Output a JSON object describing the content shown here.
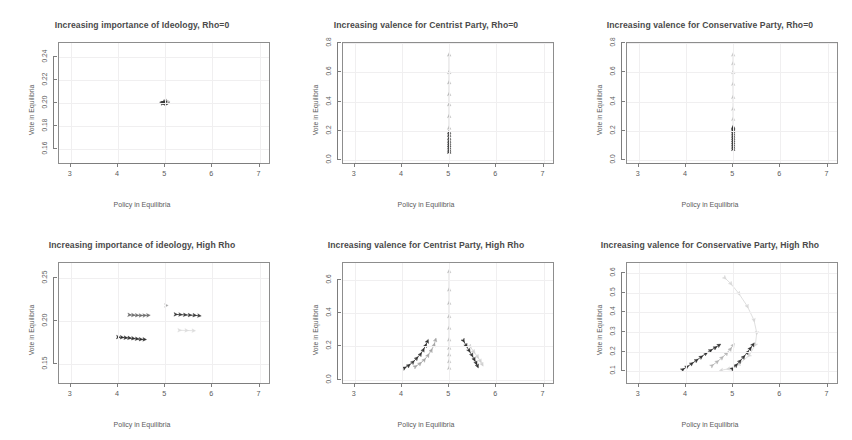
{
  "figure": {
    "layout": "2 rows x 3 columns of scatter/trajectory panels",
    "background": "#ffffff",
    "shared_xlabel": "Policy in Equilibria",
    "shared_ylabel": "Vote in Equilibria"
  },
  "chart_data": [
    {
      "id": "panel-1",
      "type": "scatter",
      "title": "Increasing importance of Ideology, Rho=0",
      "xlabel": "Policy in Equilibria",
      "ylabel": "Vote in Equilibria",
      "xlim": [
        2.75,
        7.2
      ],
      "ylim": [
        0.148,
        0.252
      ],
      "xticks": [
        3,
        4,
        5,
        6,
        7
      ],
      "xticklabels": [
        "3",
        "4",
        "5",
        "6",
        "7"
      ],
      "yticks": [
        0.16,
        0.18,
        0.2,
        0.22,
        0.24
      ],
      "yticklabels": [
        "0.16",
        "0.18",
        "0.20",
        "0.22",
        "0.24"
      ],
      "grid": true,
      "legend": "none",
      "series": [
        {
          "name": "cluster-at-center",
          "color": "#3a3a3a",
          "x": [
            4.93,
            4.95,
            4.97,
            4.99,
            5.01,
            5.03,
            5.05,
            5.02,
            4.98,
            4.96
          ],
          "y": [
            0.2,
            0.2005,
            0.201,
            0.2,
            0.1995,
            0.2,
            0.2005,
            0.2015,
            0.1998,
            0.2002
          ]
        },
        {
          "name": "faint-marker",
          "color": "#c9c9c9",
          "x": [
            5.06
          ],
          "y": [
            0.2012
          ]
        }
      ]
    },
    {
      "id": "panel-2",
      "type": "scatter",
      "title": "Increasing valence for Centrist Party, Rho=0",
      "xlabel": "Policy in Equilibria",
      "ylabel": "Vote in Equilibria",
      "xlim": [
        2.75,
        7.2
      ],
      "ylim": [
        -0.02,
        0.8
      ],
      "xticks": [
        3,
        4,
        5,
        6,
        7
      ],
      "xticklabels": [
        "3",
        "4",
        "5",
        "6",
        "7"
      ],
      "yticks": [
        0.0,
        0.2,
        0.4,
        0.6,
        0.8
      ],
      "yticklabels": [
        "0.0",
        "0.2",
        "0.4",
        "0.6",
        "0.8"
      ],
      "grid": true,
      "legend": "none",
      "series": [
        {
          "name": "centrist-rising-valence",
          "color": "#b8b8b8",
          "x": [
            5.0,
            5.0,
            5.0,
            5.0,
            5.0,
            5.0,
            5.0,
            5.0,
            5.0,
            5.0,
            5.0
          ],
          "y": [
            0.06,
            0.1,
            0.14,
            0.18,
            0.22,
            0.3,
            0.38,
            0.45,
            0.53,
            0.6,
            0.72
          ]
        },
        {
          "name": "dense-low-cluster",
          "color": "#3a3a3a",
          "x": [
            5.0,
            5.0,
            5.0,
            5.0,
            5.0,
            5.0,
            5.0,
            5.0,
            5.0
          ],
          "y": [
            0.055,
            0.07,
            0.085,
            0.1,
            0.115,
            0.13,
            0.15,
            0.17,
            0.19
          ]
        }
      ]
    },
    {
      "id": "panel-3",
      "type": "scatter",
      "title": "Increasing valence for Conservative Party, Rho=0",
      "xlabel": "Policy in Equilibria",
      "ylabel": "Vote in Equilibria",
      "xlim": [
        2.75,
        7.2
      ],
      "ylim": [
        -0.02,
        0.8
      ],
      "xticks": [
        3,
        4,
        5,
        6,
        7
      ],
      "xticklabels": [
        "3",
        "4",
        "5",
        "6",
        "7"
      ],
      "yticks": [
        0.0,
        0.2,
        0.4,
        0.6,
        0.8
      ],
      "yticklabels": [
        "0.0",
        "0.2",
        "0.4",
        "0.6",
        "0.8"
      ],
      "grid": true,
      "legend": "none",
      "series": [
        {
          "name": "conservative-rising-valence",
          "color": "#c4c4c4",
          "x": [
            5.0,
            5.0,
            5.0,
            5.0,
            5.0,
            5.0,
            5.0,
            5.0
          ],
          "y": [
            0.22,
            0.28,
            0.35,
            0.43,
            0.52,
            0.6,
            0.66,
            0.72
          ]
        },
        {
          "name": "dense-low-cluster",
          "color": "#2f2f2f",
          "x": [
            5.0,
            5.0,
            5.0,
            5.0,
            5.0,
            5.0,
            5.0,
            5.0,
            5.0,
            5.0,
            5.0,
            5.0
          ],
          "y": [
            0.075,
            0.09,
            0.105,
            0.12,
            0.135,
            0.15,
            0.165,
            0.18,
            0.195,
            0.205,
            0.215,
            0.225
          ]
        }
      ]
    },
    {
      "id": "panel-4",
      "type": "scatter",
      "title": "Increasing importance of ideology, High Rho",
      "xlabel": "Policy in Equilibria",
      "ylabel": "Vote in Equilibria",
      "xlim": [
        2.75,
        7.2
      ],
      "ylim": [
        0.128,
        0.268
      ],
      "xticks": [
        3,
        4,
        5,
        6,
        7
      ],
      "xticklabels": [
        "3",
        "4",
        "5",
        "6",
        "7"
      ],
      "yticks": [
        0.15,
        0.2,
        0.25
      ],
      "yticklabels": [
        "0.15",
        "0.20",
        "0.25"
      ],
      "grid": true,
      "legend": "none",
      "series": [
        {
          "name": "left-lower-branch",
          "color": "#2f2f2f",
          "x": [
            4.0,
            4.08,
            4.16,
            4.24,
            4.32,
            4.4,
            4.48,
            4.56
          ],
          "y": [
            0.1815,
            0.1812,
            0.1808,
            0.1805,
            0.18,
            0.1795,
            0.179,
            0.1788
          ]
        },
        {
          "name": "left-upper-branch",
          "color": "#6d6d6d",
          "x": [
            4.24,
            4.32,
            4.4,
            4.48,
            4.56,
            4.64
          ],
          "y": [
            0.2075,
            0.2072,
            0.207,
            0.2068,
            0.2068,
            0.207
          ]
        },
        {
          "name": "right-upper-branch",
          "color": "#3a3a3a",
          "x": [
            5.22,
            5.32,
            5.42,
            5.52,
            5.62,
            5.72
          ],
          "y": [
            0.208,
            0.2078,
            0.2075,
            0.2072,
            0.207,
            0.2065
          ]
        },
        {
          "name": "center-marker",
          "color": "#a8a8a8",
          "x": [
            5.02
          ],
          "y": [
            0.2185
          ]
        },
        {
          "name": "faint-right-lower",
          "color": "#dcdcdc",
          "x": [
            5.3,
            5.45,
            5.6
          ],
          "y": [
            0.1895,
            0.1893,
            0.189
          ]
        }
      ]
    },
    {
      "id": "panel-5",
      "type": "scatter",
      "title": "Increasing valence for Centrist Party, High Rho",
      "xlabel": "Policy in Equilibria",
      "ylabel": "Vote in Equilibria",
      "xlim": [
        2.75,
        7.2
      ],
      "ylim": [
        -0.02,
        0.7
      ],
      "xticks": [
        3,
        4,
        5,
        6,
        7
      ],
      "xticklabels": [
        "3",
        "4",
        "5",
        "6",
        "7"
      ],
      "yticks": [
        0.0,
        0.2,
        0.4,
        0.6
      ],
      "yticklabels": [
        "0.0",
        "0.2",
        "0.4",
        "0.6"
      ],
      "grid": true,
      "legend": "none",
      "series": [
        {
          "name": "centrist-vertical-column",
          "color": "#bdbdbd",
          "x": [
            5.0,
            5.0,
            5.0,
            5.0,
            5.0,
            5.0,
            5.0,
            5.0,
            5.0,
            5.0
          ],
          "y": [
            0.07,
            0.11,
            0.15,
            0.19,
            0.24,
            0.31,
            0.38,
            0.46,
            0.54,
            0.65
          ]
        },
        {
          "name": "left-branch-dark",
          "color": "#2f2f2f",
          "x": [
            4.05,
            4.14,
            4.23,
            4.31,
            4.39,
            4.45,
            4.5,
            4.54
          ],
          "y": [
            0.07,
            0.085,
            0.105,
            0.128,
            0.152,
            0.178,
            0.205,
            0.23
          ]
        },
        {
          "name": "left-branch-light",
          "color": "#a5a5a5",
          "x": [
            4.28,
            4.38,
            4.47,
            4.55,
            4.62,
            4.68,
            4.71
          ],
          "y": [
            0.078,
            0.096,
            0.118,
            0.145,
            0.175,
            0.208,
            0.238
          ]
        },
        {
          "name": "right-branch-dark",
          "color": "#2f2f2f",
          "x": [
            5.3,
            5.36,
            5.42,
            5.48,
            5.53,
            5.57,
            5.6
          ],
          "y": [
            0.235,
            0.205,
            0.175,
            0.148,
            0.122,
            0.1,
            0.082
          ]
        },
        {
          "name": "right-branch-light",
          "color": "#cfcfcf",
          "x": [
            5.44,
            5.52,
            5.6,
            5.66,
            5.7
          ],
          "y": [
            0.2,
            0.168,
            0.138,
            0.112,
            0.092
          ]
        }
      ]
    },
    {
      "id": "panel-6",
      "type": "scatter",
      "title": "Increasing valence for Conservative Party, High Rho",
      "xlabel": "Policy in Equilibria",
      "ylabel": "Vote in Equilibria",
      "xlim": [
        2.75,
        7.2
      ],
      "ylim": [
        0.04,
        0.65
      ],
      "xticks": [
        3,
        4,
        5,
        6,
        7
      ],
      "xticklabels": [
        "3",
        "4",
        "5",
        "6",
        "7"
      ],
      "yticks": [
        0.1,
        0.2,
        0.3,
        0.4,
        0.5,
        0.6
      ],
      "yticklabels": [
        "0.1",
        "0.2",
        "0.3",
        "0.4",
        "0.5",
        "0.6"
      ],
      "grid": true,
      "legend": "none",
      "series": [
        {
          "name": "conservative-arc-faint",
          "color": "#d7d7d7",
          "x": [
            4.82,
            4.95,
            5.12,
            5.3,
            5.44,
            5.5,
            5.47,
            5.34,
            5.12,
            4.9,
            4.75
          ],
          "y": [
            0.575,
            0.545,
            0.495,
            0.43,
            0.36,
            0.295,
            0.235,
            0.18,
            0.135,
            0.112,
            0.105
          ]
        },
        {
          "name": "left-branch-dark",
          "color": "#2f2f2f",
          "x": [
            3.93,
            4.02,
            4.12,
            4.22,
            4.32,
            4.42,
            4.52,
            4.62,
            4.7
          ],
          "y": [
            0.108,
            0.122,
            0.138,
            0.155,
            0.172,
            0.19,
            0.205,
            0.22,
            0.232
          ]
        },
        {
          "name": "left-branch-light",
          "color": "#b5b5b5",
          "x": [
            4.55,
            4.66,
            4.76,
            4.86,
            4.94,
            5.0
          ],
          "y": [
            0.128,
            0.148,
            0.168,
            0.19,
            0.212,
            0.232
          ]
        },
        {
          "name": "right-branch-dark",
          "color": "#2f2f2f",
          "x": [
            4.98,
            5.06,
            5.14,
            5.22,
            5.3,
            5.36,
            5.42
          ],
          "y": [
            0.112,
            0.13,
            0.15,
            0.172,
            0.195,
            0.215,
            0.235
          ]
        }
      ]
    }
  ]
}
